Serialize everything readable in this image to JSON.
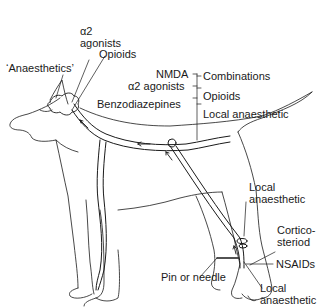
{
  "diagram": {
    "labels": {
      "alpha2_agonists_brain": [
        "α2",
        "agonists"
      ],
      "opioids_brain": "Opioids",
      "anaesthetics": "‘Anaesthetics’",
      "spinal_left": [
        "NMDA",
        "α2 agonists",
        "Benzodiazepines"
      ],
      "spinal_right": [
        "Combinations",
        "Opioids",
        "Local anaesthetic"
      ],
      "local_anaesthetic_nerve": [
        "Local",
        "anaesthetic"
      ],
      "corticosteroid": [
        "Cortico-",
        "steriod"
      ],
      "nsaids": "NSAIDs",
      "pin_or_needle": "Pin or needle",
      "local_anaesthetic_paw": [
        "Local",
        "anaesthetic"
      ]
    },
    "colors": {
      "line": "#1a1a1a",
      "background": "#ffffff"
    }
  }
}
